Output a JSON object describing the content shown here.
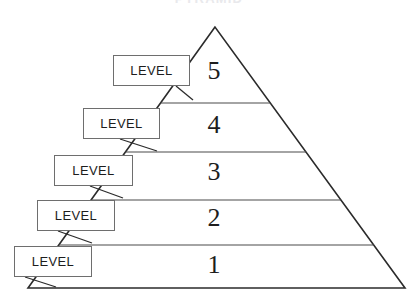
{
  "diagram": {
    "type": "pyramid",
    "title": "PYRAMID",
    "tier_count": 5,
    "orientation": "apex-up",
    "geometry": {
      "apex": [
        215,
        27
      ],
      "base_left": [
        28,
        288
      ],
      "base_right": [
        405,
        288
      ],
      "divider_y": [
        103,
        152,
        200,
        245
      ]
    },
    "tiers": [
      {
        "number": "5",
        "label": "LEVEL",
        "number_x": 214,
        "number_y": 58,
        "box": {
          "x": 113,
          "y": 55,
          "w": 77,
          "h": 31
        },
        "connector": {
          "x1": 176,
          "y1": 86,
          "x2": 193,
          "y2": 100
        }
      },
      {
        "number": "4",
        "label": "LEVEL",
        "number_x": 214,
        "number_y": 112,
        "box": {
          "x": 83,
          "y": 108,
          "w": 77,
          "h": 31
        },
        "connector": {
          "x1": 120,
          "y1": 139,
          "x2": 157,
          "y2": 151
        }
      },
      {
        "number": "3",
        "label": "LEVEL",
        "number_x": 214,
        "number_y": 159,
        "box": {
          "x": 54,
          "y": 155,
          "w": 79,
          "h": 31
        },
        "connector": {
          "x1": 90,
          "y1": 186,
          "x2": 123,
          "y2": 198
        }
      },
      {
        "number": "2",
        "label": "LEVEL",
        "number_x": 214,
        "number_y": 205,
        "box": {
          "x": 37,
          "y": 200,
          "w": 78,
          "h": 31
        },
        "connector": {
          "x1": 58,
          "y1": 231,
          "x2": 92,
          "y2": 243
        }
      },
      {
        "number": "1",
        "label": "LEVEL",
        "number_x": 214,
        "number_y": 252,
        "box": {
          "x": 14,
          "y": 246,
          "w": 78,
          "h": 31
        },
        "connector": {
          "x1": 25,
          "y1": 277,
          "x2": 56,
          "y2": 287
        }
      }
    ],
    "colors": {
      "outline": "#2b2b2b",
      "divider": "#4a4a4a",
      "box_border": "#6e6e6e",
      "box_fill": "#ffffff",
      "text": "#1d1d1d",
      "background": "#ffffff",
      "title": "#e9e9ec"
    }
  }
}
